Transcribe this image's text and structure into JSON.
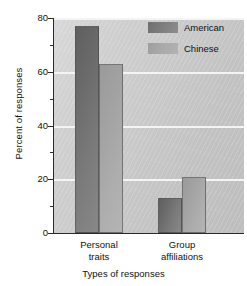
{
  "chart_data": {
    "type": "bar",
    "title": "",
    "xlabel": "Types of responses",
    "ylabel": "Percent of responses",
    "categories": [
      "Personal traits",
      "Group affiliations"
    ],
    "category_lines": [
      [
        "Personal",
        "traits"
      ],
      [
        "Group",
        "affiliations"
      ]
    ],
    "series": [
      {
        "name": "American",
        "values": [
          77,
          13
        ],
        "color": "#6e6e6e"
      },
      {
        "name": "Chinese",
        "values": [
          63,
          21
        ],
        "color": "#a8a8a8"
      }
    ],
    "ylim": [
      0,
      80
    ],
    "yticks": [
      0,
      20,
      40,
      60,
      80
    ],
    "ytick_labels": [
      "0",
      "20",
      "40",
      "60",
      "80"
    ],
    "yminor_ticks": [
      10,
      30,
      50,
      70
    ],
    "grid": true,
    "grid_color": "#f4f4f4",
    "legend_position": "top-right",
    "plot_background": "#cdcdcd"
  },
  "legend": {
    "entries": [
      {
        "label": "American"
      },
      {
        "label": "Chinese"
      }
    ]
  }
}
